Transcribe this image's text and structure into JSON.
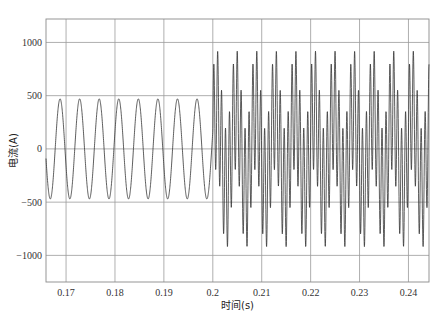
{
  "chart_data": {
    "type": "line",
    "title": "",
    "xlabel": "时间(s)",
    "ylabel": "电流(A)",
    "xlim": [
      0.1659,
      0.2442
    ],
    "ylim": [
      -1250,
      1220
    ],
    "x_ticks": [
      0.17,
      0.18,
      0.19,
      0.2,
      0.21,
      0.22,
      0.23,
      0.24
    ],
    "x_tick_labels": [
      "0.17",
      "0.18",
      "0.19",
      "0.2",
      "0.21",
      "0.22",
      "0.23",
      "0.24"
    ],
    "y_ticks": [
      1000,
      500,
      0,
      -500,
      -1000
    ],
    "y_tick_labels": [
      "1000",
      "500",
      "0",
      "−500",
      "−1000"
    ],
    "grid": true,
    "legend": null,
    "series": [
      {
        "name": "电流",
        "description": "Steady sinusoid before t=0.2s (~250 Hz, amplitude ~470 A); after t=0.2s a distorted waveform with harmonic content, peaks ~+950 A and troughs ~-1000 A",
        "segments": [
          {
            "t_start": 0.1659,
            "t_end": 0.2,
            "components": [
              {
                "freq_hz": 250,
                "amp": 470,
                "phase": 0.35
              }
            ]
          },
          {
            "t_start": 0.2,
            "t_end": 0.2442,
            "components": [
              {
                "freq_hz": 250,
                "amp": 380,
                "phase": 0.35
              },
              {
                "freq_hz": 1250,
                "amp": 560,
                "phase": 0.0
              }
            ]
          }
        ],
        "color": "#333333"
      }
    ]
  }
}
